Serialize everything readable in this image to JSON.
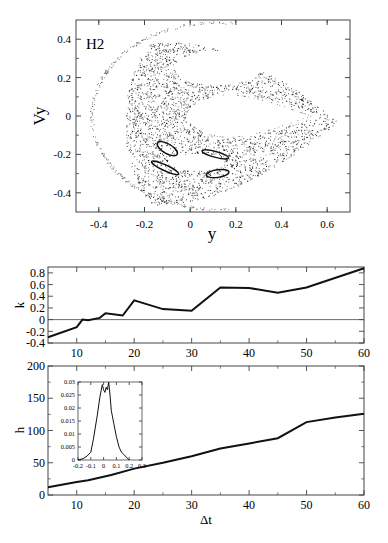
{
  "chart_data": [
    {
      "id": "poincare",
      "type": "scatter",
      "title": "",
      "panel_label": "H2",
      "xlabel": "y",
      "ylabel": "Vy",
      "xlim": [
        -0.5,
        0.7
      ],
      "ylim": [
        -0.5,
        0.5
      ],
      "xticks": [
        -0.4,
        -0.2,
        0,
        0.2,
        0.4,
        0.6
      ],
      "xtick_labels": [
        "-0.4",
        "-0.2",
        "0",
        "0.2",
        "0.4",
        "0.6"
      ],
      "yticks": [
        -0.4,
        -0.2,
        0,
        0.2,
        0.4
      ],
      "ytick_labels": [
        "-0.4",
        "-0.2",
        "0",
        "0.2",
        "0.4"
      ],
      "grid": false,
      "description": "Poincare section: outer sparse arc from (-0.43,0) spanning vy in [-0.5,0.5]; dense chaotic band in y∈[-0.28,0.65]; two empty regular islands (upper ~(-0.05..0.3, 0.2..0.35), central lobe ~(-0.02..0.55, -0.1..0.1)); four small dark resonance island chains near (-0.1,-0.17), (0.1,-0.2), (-0.12,-0.27), (0.12,-0.3)",
      "islands": [
        {
          "cx": -0.1,
          "cy": -0.17,
          "rx": 0.05,
          "ry": 0.025,
          "angle": -30
        },
        {
          "cx": 0.11,
          "cy": -0.2,
          "rx": 0.06,
          "ry": 0.015,
          "angle": -15
        },
        {
          "cx": -0.11,
          "cy": -0.27,
          "rx": 0.065,
          "ry": 0.015,
          "angle": -25
        },
        {
          "cx": 0.12,
          "cy": -0.3,
          "rx": 0.05,
          "ry": 0.02,
          "angle": 8
        }
      ]
    },
    {
      "id": "k_vs_dt",
      "type": "line",
      "xlabel": "Δt",
      "ylabel": "k",
      "xlim": [
        5,
        60
      ],
      "ylim": [
        -0.4,
        0.9
      ],
      "xticks": [
        10,
        20,
        30,
        40,
        50,
        60
      ],
      "xtick_labels": [
        "10",
        "20",
        "30",
        "40",
        "50",
        "60"
      ],
      "yticks": [
        -0.4,
        -0.2,
        0,
        0.2,
        0.4,
        0.6,
        0.8
      ],
      "ytick_labels": [
        "-0.4",
        "-0.2",
        "0",
        "0.2",
        "0.4",
        "0.6",
        "0.8"
      ],
      "zero_line": true,
      "grid": false,
      "x": [
        5,
        10,
        11,
        12,
        14,
        15,
        18,
        20,
        25,
        30,
        35,
        40,
        45,
        50,
        60
      ],
      "values": [
        -0.3,
        -0.13,
        0.0,
        -0.01,
        0.03,
        0.11,
        0.07,
        0.33,
        0.18,
        0.15,
        0.55,
        0.54,
        0.46,
        0.55,
        0.88
      ]
    },
    {
      "id": "h_vs_dt",
      "type": "line",
      "xlabel": "Δt",
      "ylabel": "h",
      "xlim": [
        5,
        60
      ],
      "ylim": [
        0,
        200
      ],
      "xticks": [
        10,
        20,
        30,
        40,
        50,
        60
      ],
      "xtick_labels": [
        "10",
        "20",
        "30",
        "40",
        "50",
        "60"
      ],
      "yticks": [
        0,
        50,
        100,
        150,
        200
      ],
      "ytick_labels": [
        "0",
        "50",
        "100",
        "150",
        "200"
      ],
      "grid": false,
      "x": [
        5,
        10,
        12,
        16,
        20,
        25,
        30,
        35,
        40,
        45,
        50,
        55,
        60
      ],
      "values": [
        12,
        20,
        23,
        31,
        41,
        50,
        60,
        72,
        80,
        88,
        113,
        120,
        126
      ],
      "inset": {
        "type": "line",
        "xlim": [
          -0.2,
          0.3
        ],
        "ylim": [
          0,
          0.03
        ],
        "xticks": [
          -0.2,
          -0.1,
          0,
          0.1,
          0.2,
          0.3
        ],
        "xtick_labels": [
          "-0.2",
          "-0.1",
          "0",
          "0.1",
          "0.2",
          "0.3"
        ],
        "yticks": [
          0,
          0.005,
          0.01,
          0.015,
          0.02,
          0.025,
          0.03
        ],
        "ytick_labels": [
          "0",
          "0.005",
          "0.01",
          "0.015",
          "0.02",
          "0.025",
          "0.03"
        ],
        "x": [
          -0.2,
          -0.16,
          -0.13,
          -0.1,
          -0.08,
          -0.05,
          -0.03,
          -0.01,
          0.0,
          0.01,
          0.02,
          0.03,
          0.04,
          0.05,
          0.06,
          0.08,
          0.1,
          0.12,
          0.14,
          0.16,
          0.18,
          0.2
        ],
        "values": [
          0.0,
          0.0005,
          0.0015,
          0.003,
          0.008,
          0.017,
          0.024,
          0.029,
          0.027,
          0.026,
          0.028,
          0.027,
          0.03,
          0.025,
          0.019,
          0.014,
          0.009,
          0.005,
          0.003,
          0.002,
          0.001,
          0.0
        ]
      }
    }
  ]
}
